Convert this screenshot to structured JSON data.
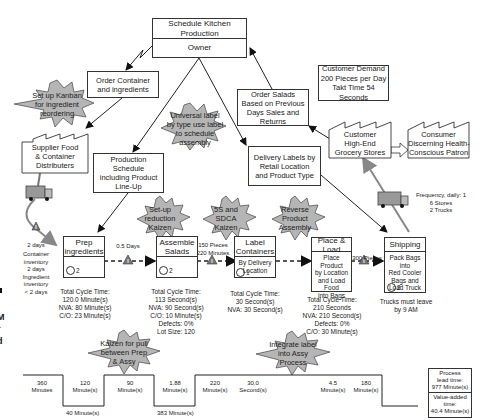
{
  "control": {
    "title": "Schedule Kitchen Production",
    "subtitle": "Owner"
  },
  "info_boxes": {
    "order_container": "Order Container and ingredients",
    "order_salads": "Order Salads Based on Previous Days Sales and Returns",
    "production_schedule": "Production Schedule including Product Line-Up",
    "delivery_labels": "Delivery Labels by Retail Location and Product Type",
    "customer_demand": [
      "Customer Demand",
      "200 Pieces per Day",
      "Takt Time 54 Seconds"
    ]
  },
  "factories": {
    "supplier": [
      "Supplier Food",
      "& Container",
      "Distributers"
    ],
    "customer": [
      "Customer",
      "High-End",
      "Grocery Stores"
    ],
    "consumer": [
      "Consumer",
      "Discerning Health-",
      "Conscious Patron"
    ]
  },
  "kaizen_bursts": [
    {
      "id": "kanban",
      "lines": [
        "Set up Kanban",
        "for ingredient",
        "reordering"
      ]
    },
    {
      "id": "universal-label",
      "lines": [
        "Universal label",
        "by type use label",
        "to schedule",
        "assembly"
      ]
    },
    {
      "id": "setup-reduction",
      "lines": [
        "Set-up",
        "reduction",
        "Kaizen"
      ]
    },
    {
      "id": "5s-sdca",
      "lines": [
        "5S and",
        "SDCA",
        "Kaizen"
      ]
    },
    {
      "id": "reverse-assembly",
      "lines": [
        "Reverse",
        "Product",
        "Assembly"
      ]
    },
    {
      "id": "pull-kaizen",
      "lines": [
        "Kaizen for pull",
        "between Prep",
        "& Assy"
      ]
    },
    {
      "id": "integrate-label",
      "lines": [
        "Integrate label",
        "into Assy",
        "Process"
      ]
    }
  ],
  "supplier_shipment": {
    "days": "2 days",
    "inventory": [
      "Container",
      "inventory",
      "2 days",
      "Ingredient",
      "inventory",
      "< 2 days"
    ]
  },
  "customer_shipment": {
    "lines": [
      "Frequency, daily: 1",
      "6 Stores",
      "2 Trucks"
    ]
  },
  "processes": [
    {
      "name": [
        "Prep",
        "ingredients"
      ],
      "body": [],
      "operators": "2",
      "data": [
        "Total Cycle Time:",
        "120.0 Minute(s)",
        "NVA: 80 Minute(s)",
        "C/O: 23 Minute(s)"
      ]
    },
    {
      "name": [
        "Assemble",
        "Salads"
      ],
      "body": [],
      "operators": "2",
      "data": [
        "Total Cycle Time:",
        "113 Second(s)",
        "NVA: 90 Second(s)",
        "C/O: 10 Minute(s)",
        "Defects: 0%",
        "Lot Size: 120"
      ]
    },
    {
      "name": [
        "Label",
        "Containers"
      ],
      "body": [
        "By Delivery",
        "Location"
      ],
      "operators": "1",
      "data": [
        "Total Cycle Time:",
        "30 Second(s)",
        "NVA: 30 Second(s)"
      ]
    },
    {
      "name": [
        "Place & Load"
      ],
      "body": [
        "Place Product",
        "by Location",
        "and Load Food",
        "into Bags"
      ],
      "operators": "",
      "data": [
        "Total Cycle Time:",
        "210 Seconds",
        "NVA: 210 Second(s)",
        "Defects: 0%",
        "C/O: 30 Minute(s)"
      ]
    },
    {
      "name": [
        "Shipping"
      ],
      "body": [
        "Pack Bags into",
        "Red Cooler",
        "Bags and",
        "Load Truck"
      ],
      "operators": "2",
      "data": [
        "Trucks must leave",
        "by 9 AM"
      ]
    }
  ],
  "inventories": [
    {
      "label": [
        "0.5 Days"
      ]
    },
    {
      "label": [
        "150 Pieces",
        "220 Minutes"
      ]
    },
    {
      "label": [
        "300 Pieces"
      ]
    }
  ],
  "timeline": {
    "upper": [
      [
        "360",
        "Minutes"
      ],
      [
        "120",
        "Minute(s)"
      ],
      [
        "90",
        "Minute(s)"
      ],
      [
        "1.88",
        "Minute(s)"
      ],
      [
        "220",
        "Minute(s)"
      ],
      [
        "30.0",
        "Second(s)"
      ],
      [
        "4.5",
        "Minute(s)"
      ],
      [
        "180",
        "Minute(s)"
      ]
    ],
    "lower": [
      "40 Minute(s)",
      "383 Minute(s)"
    ],
    "summary": {
      "lead_time": [
        "Process",
        "lead time:",
        "977 Minute(s)"
      ],
      "value_added": [
        "Value-added",
        "time:",
        "40.4 Minute(s)"
      ]
    }
  },
  "caption_fragment": [
    ":",
    "M",
    "r",
    "d",
    "."
  ]
}
